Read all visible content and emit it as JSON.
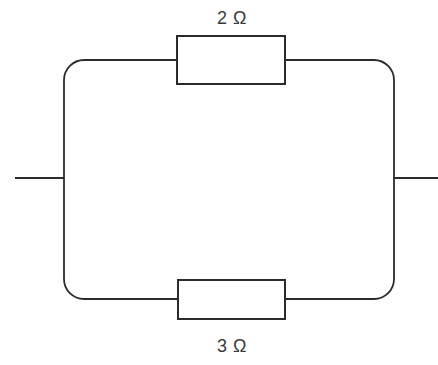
{
  "diagram": {
    "type": "electrical-circuit-schematic",
    "background_color": "#ffffff",
    "line_color": "#2b2b2b",
    "label_color": "#3a3a3a",
    "components": [
      {
        "id": "resistor-top",
        "kind": "resistor",
        "label": "2 Ω",
        "value": "2",
        "unit": "Ω",
        "branch": "top"
      },
      {
        "id": "resistor-bottom",
        "kind": "resistor",
        "label": "3 Ω",
        "value": "3",
        "unit": "Ω",
        "branch": "bottom"
      }
    ],
    "terminals": [
      {
        "id": "terminal-left",
        "side": "left"
      },
      {
        "id": "terminal-right",
        "side": "right"
      }
    ]
  }
}
